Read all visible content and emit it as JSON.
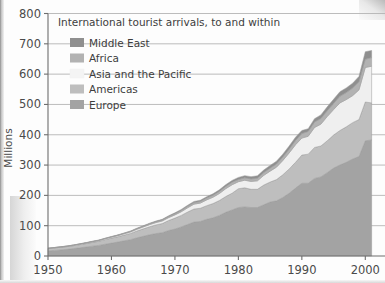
{
  "chart_data": {
    "type": "area",
    "title": "International tourist arrivals, to and within",
    "xlabel": "",
    "ylabel": "Millions",
    "xlim": [
      1950,
      2002
    ],
    "ylim": [
      0,
      800
    ],
    "xticks": [
      1950,
      1960,
      1970,
      1980,
      1990,
      2000
    ],
    "yticks": [
      0,
      100,
      200,
      300,
      400,
      500,
      600,
      700,
      800
    ],
    "grid": true,
    "legend_position": "upper-left-inside",
    "stacked": true,
    "stack_order_bottom_to_top": [
      "Europe",
      "Americas",
      "Asia and the Pacific",
      "Africa",
      "Middle East"
    ],
    "x": [
      1950,
      1951,
      1952,
      1953,
      1954,
      1955,
      1956,
      1957,
      1958,
      1959,
      1960,
      1961,
      1962,
      1963,
      1964,
      1965,
      1966,
      1967,
      1968,
      1969,
      1970,
      1971,
      1972,
      1973,
      1974,
      1975,
      1976,
      1977,
      1978,
      1979,
      1980,
      1981,
      1982,
      1983,
      1984,
      1985,
      1986,
      1987,
      1988,
      1989,
      1990,
      1991,
      1992,
      1993,
      1994,
      1995,
      1996,
      1997,
      1998,
      1999,
      2000,
      2001
    ],
    "series": [
      {
        "name": "Europe",
        "color": "#a3a3a3",
        "values": [
          16.8,
          18.5,
          20.2,
          22.0,
          24.5,
          27.0,
          29.5,
          32.5,
          35.0,
          39.0,
          42.5,
          46.0,
          50.0,
          54.0,
          60.0,
          65.0,
          70.0,
          74.0,
          77.0,
          84.0,
          89.0,
          96.0,
          104.0,
          112.0,
          114.0,
          121.0,
          126.0,
          134.0,
          144.0,
          152.0,
          160.0,
          162.0,
          160.0,
          160.0,
          169.0,
          178.0,
          182.0,
          193.0,
          207.0,
          224.0,
          240.0,
          240.0,
          256.0,
          261.0,
          275.0,
          290.0,
          300.0,
          309.0,
          320.0,
          328.0,
          380.0,
          383.0
        ]
      },
      {
        "name": "Americas",
        "color": "#bebebe",
        "values": [
          7.5,
          8.0,
          8.5,
          9.0,
          9.5,
          10.5,
          11.5,
          12.5,
          13.5,
          15.0,
          16.5,
          17.5,
          19.0,
          20.5,
          22.5,
          24.5,
          26.5,
          28.5,
          30.0,
          33.0,
          36.0,
          38.0,
          41.0,
          43.0,
          43.5,
          45.0,
          47.0,
          49.0,
          52.0,
          55.0,
          62.0,
          63.0,
          60.0,
          60.0,
          65.0,
          66.0,
          70.0,
          75.0,
          80.0,
          85.0,
          93.0,
          96.0,
          102.0,
          102.0,
          105.0,
          109.0,
          114.0,
          117.0,
          120.0,
          122.0,
          128.0,
          122.0
        ]
      },
      {
        "name": "Asia and the Pacific",
        "color": "#efefef",
        "values": [
          0.8,
          0.9,
          1.0,
          1.2,
          1.4,
          1.6,
          1.8,
          2.1,
          2.4,
          2.8,
          3.2,
          3.6,
          4.2,
          4.8,
          5.5,
          6.2,
          7.0,
          7.8,
          8.5,
          9.5,
          10.5,
          12.0,
          14.0,
          16.0,
          17.0,
          19.0,
          21.0,
          23.0,
          26.0,
          28.0,
          23.0,
          25.0,
          26.0,
          28.0,
          32.0,
          36.0,
          41.0,
          47.0,
          53.0,
          58.0,
          56.0,
          59.0,
          66.0,
          72.0,
          80.0,
          84.0,
          91.0,
          90.0,
          89.0,
          98.0,
          114.0,
          121.0
        ]
      },
      {
        "name": "Africa",
        "color": "#b2b2b2",
        "values": [
          0.5,
          0.5,
          0.6,
          0.6,
          0.7,
          0.8,
          0.9,
          1.0,
          1.1,
          1.3,
          1.4,
          1.6,
          1.8,
          2.0,
          2.2,
          2.5,
          2.8,
          3.0,
          3.3,
          3.6,
          4.0,
          4.4,
          4.8,
          5.2,
          5.5,
          6.0,
          6.5,
          7.0,
          7.6,
          8.2,
          7.3,
          7.8,
          8.2,
          8.6,
          9.2,
          9.8,
          10.4,
          11.2,
          12.4,
          13.8,
          15.0,
          16.0,
          18.0,
          18.5,
          19.0,
          20.0,
          22.0,
          23.0,
          25.0,
          26.5,
          27.0,
          28.5
        ]
      },
      {
        "name": "Middle East",
        "color": "#8f8f8f",
        "values": [
          0.2,
          0.2,
          0.3,
          0.3,
          0.4,
          0.4,
          0.5,
          0.6,
          0.7,
          0.8,
          0.9,
          1.0,
          1.1,
          1.3,
          1.5,
          1.7,
          1.9,
          2.1,
          2.3,
          2.6,
          2.9,
          3.2,
          3.5,
          3.8,
          4.0,
          4.4,
          4.8,
          5.2,
          5.6,
          6.0,
          7.0,
          7.3,
          7.6,
          7.9,
          8.4,
          9.0,
          9.3,
          9.8,
          10.4,
          11.0,
          10.0,
          9.0,
          11.0,
          12.0,
          13.0,
          14.0,
          15.0,
          15.5,
          16.0,
          18.0,
          25.0,
          23.5
        ]
      }
    ],
    "totals_note": "",
    "legend_entries": [
      {
        "label": "Middle East",
        "color": "#8f8f8f"
      },
      {
        "label": "Africa",
        "color": "#b2b2b2"
      },
      {
        "label": "Asia and the Pacific",
        "color": "#f4f4f4"
      },
      {
        "label": "Americas",
        "color": "#bebebe"
      },
      {
        "label": "Europe",
        "color": "#a3a3a3"
      }
    ]
  },
  "style": {
    "gridline_color": "#b4b4b4",
    "axis_color": "#6e6e6e",
    "text_color": "#3d3d3d",
    "background": "#fdfdfd"
  }
}
